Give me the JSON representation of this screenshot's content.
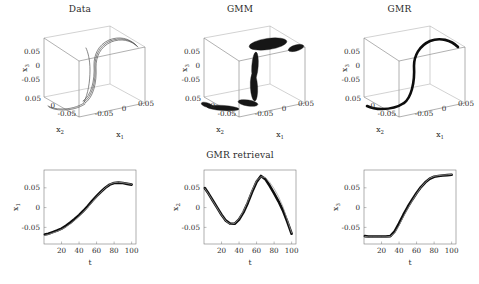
{
  "figure": {
    "background": "#ffffff",
    "curve_color": "#0d0d0d",
    "reference_color": "#9e9e9e",
    "axis_color": "#6f6f6f"
  },
  "panels_top": [
    {
      "id": "data",
      "title": "Data"
    },
    {
      "id": "gmm",
      "title": "GMM"
    },
    {
      "id": "gmr",
      "title": "GMR"
    }
  ],
  "panels_bottom": {
    "title": "GMR retrieval",
    "items": [
      {
        "id": "x1",
        "ylabel": "x",
        "ysub": "1"
      },
      {
        "id": "x2",
        "ylabel": "x",
        "ysub": "2"
      },
      {
        "id": "x3",
        "ylabel": "x",
        "ysub": "3"
      }
    ]
  },
  "axes3d": {
    "x1_label": "x",
    "x1_sub": "1",
    "x2_label": "x",
    "x2_sub": "2",
    "x3_label": "x",
    "x3_sub": "3",
    "x1_ticks": [
      "-0.05",
      "0",
      "0.05"
    ],
    "x2_ticks": [
      "0.05",
      "0",
      "-0.05"
    ],
    "x3_ticks": [
      "0.05",
      "0",
      "-0.05"
    ]
  },
  "axes2d": {
    "xlabel": "t",
    "x_ticks": [
      20,
      40,
      60,
      80,
      100
    ],
    "y_ticks": [
      "0.05",
      "0",
      "-0.05"
    ],
    "xlim": [
      0,
      105
    ],
    "ylim": [
      -0.092,
      0.095
    ]
  },
  "chart_data": {
    "type": "line",
    "title": "GMR retrieval",
    "xlabel": "t",
    "xlim": [
      0,
      105
    ],
    "ylim": [
      -0.092,
      0.095
    ],
    "grid": false,
    "legend": "none",
    "x": [
      1,
      5,
      10,
      15,
      20,
      25,
      30,
      35,
      40,
      45,
      50,
      55,
      60,
      65,
      70,
      75,
      80,
      85,
      90,
      95,
      100
    ],
    "series": [
      {
        "name": "x1 retrieved",
        "panel": "x1",
        "ylabel": "x_1",
        "style": "thick-black",
        "values": [
          -0.068,
          -0.066,
          -0.062,
          -0.058,
          -0.053,
          -0.046,
          -0.038,
          -0.029,
          -0.019,
          -0.008,
          0.004,
          0.017,
          0.029,
          0.04,
          0.05,
          0.058,
          0.062,
          0.063,
          0.062,
          0.06,
          0.058
        ]
      },
      {
        "name": "x1 demonstrations",
        "panel": "x1",
        "ylabel": "x_1",
        "style": "thin-gray",
        "values": [
          -0.07,
          -0.068,
          -0.064,
          -0.06,
          -0.055,
          -0.049,
          -0.041,
          -0.032,
          -0.022,
          -0.011,
          0.001,
          0.014,
          0.027,
          0.039,
          0.05,
          0.059,
          0.063,
          0.064,
          0.063,
          0.061,
          0.059
        ]
      },
      {
        "name": "x2 retrieved",
        "panel": "x2",
        "ylabel": "x_2",
        "style": "thick-black",
        "values": [
          0.049,
          0.036,
          0.018,
          0.0,
          -0.018,
          -0.033,
          -0.041,
          -0.041,
          -0.03,
          -0.012,
          0.012,
          0.04,
          0.065,
          0.08,
          0.072,
          0.055,
          0.036,
          0.016,
          -0.007,
          -0.035,
          -0.066
        ]
      },
      {
        "name": "x2 demonstrations",
        "panel": "x2",
        "ylabel": "x_2",
        "style": "thin-gray",
        "values": [
          0.048,
          0.035,
          0.017,
          -0.001,
          -0.019,
          -0.034,
          -0.042,
          -0.04,
          -0.028,
          -0.009,
          0.016,
          0.044,
          0.068,
          0.078,
          0.076,
          0.064,
          0.048,
          0.028,
          0.003,
          -0.03,
          -0.064
        ]
      },
      {
        "name": "x3 retrieved",
        "panel": "x3",
        "ylabel": "x_3",
        "style": "thick-black",
        "values": [
          -0.072,
          -0.073,
          -0.073,
          -0.073,
          -0.073,
          -0.073,
          -0.072,
          -0.06,
          -0.04,
          -0.018,
          0.002,
          0.02,
          0.037,
          0.052,
          0.064,
          0.073,
          0.078,
          0.08,
          0.081,
          0.082,
          0.083
        ]
      },
      {
        "name": "x3 demonstrations",
        "panel": "x3",
        "ylabel": "x_3",
        "style": "thin-gray",
        "values": [
          -0.073,
          -0.074,
          -0.074,
          -0.074,
          -0.074,
          -0.074,
          -0.073,
          -0.064,
          -0.045,
          -0.023,
          -0.002,
          0.017,
          0.035,
          0.051,
          0.064,
          0.074,
          0.079,
          0.081,
          0.082,
          0.083,
          0.084
        ]
      }
    ]
  },
  "trajectory_3d": {
    "type": "scatter",
    "description": "Three-dimensional trajectory in x1-x2-x3 space",
    "points": [
      {
        "x1": -0.068,
        "x2": 0.049,
        "x3": -0.072
      },
      {
        "x1": -0.062,
        "x2": 0.018,
        "x3": -0.073
      },
      {
        "x1": -0.053,
        "x2": -0.018,
        "x3": -0.073
      },
      {
        "x1": -0.038,
        "x2": -0.041,
        "x3": -0.072
      },
      {
        "x1": -0.019,
        "x2": -0.03,
        "x3": -0.04
      },
      {
        "x1": 0.004,
        "x2": 0.012,
        "x3": 0.002
      },
      {
        "x1": 0.029,
        "x2": 0.065,
        "x3": 0.037
      },
      {
        "x1": 0.05,
        "x2": 0.072,
        "x3": 0.064
      },
      {
        "x1": 0.062,
        "x2": 0.036,
        "x3": 0.078
      },
      {
        "x1": 0.058,
        "x2": -0.066,
        "x3": 0.083
      }
    ]
  }
}
